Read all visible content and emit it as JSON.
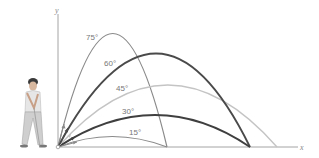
{
  "figure": {
    "type": "projectile-trajectories",
    "axes": {
      "x_label": "x",
      "y_label": "y"
    },
    "trajectories": [
      {
        "angle": "75°",
        "color": "#8a8a8a",
        "width": 1.2
      },
      {
        "angle": "60°",
        "color": "#4a4a4a",
        "width": 1.8
      },
      {
        "angle": "45°",
        "color": "#c4c4c4",
        "width": 1.3
      },
      {
        "angle": "30°",
        "color": "#3f3f3f",
        "width": 1.8
      },
      {
        "angle": "15°",
        "color": "#8a8a8a",
        "width": 1.2
      }
    ],
    "illustration": "golfer-swinging"
  }
}
